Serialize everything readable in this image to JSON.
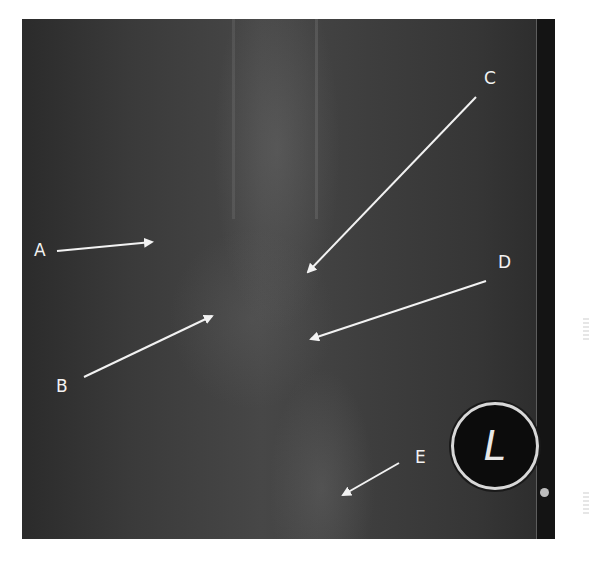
{
  "figure": {
    "type": "radiograph",
    "side_marker": "L",
    "colors": {
      "background": "#ffffff",
      "film": "#3a3a3a",
      "annotation": "#f2f2f2"
    }
  },
  "labels": [
    {
      "id": "A",
      "text": "A",
      "x": 34,
      "y": 242,
      "arrow": {
        "x1": 57,
        "y1": 251,
        "x2": 152,
        "y2": 242
      }
    },
    {
      "id": "B",
      "text": "B",
      "x": 56,
      "y": 378,
      "arrow": {
        "x1": 84,
        "y1": 377,
        "x2": 212,
        "y2": 316
      }
    },
    {
      "id": "C",
      "text": "C",
      "x": 484,
      "y": 70,
      "arrow": {
        "x1": 476,
        "y1": 97,
        "x2": 308,
        "y2": 272
      }
    },
    {
      "id": "D",
      "text": "D",
      "x": 498,
      "y": 254,
      "arrow": {
        "x1": 486,
        "y1": 281,
        "x2": 311,
        "y2": 339
      }
    },
    {
      "id": "E",
      "text": "E",
      "x": 415,
      "y": 449,
      "arrow": {
        "x1": 399,
        "y1": 463,
        "x2": 343,
        "y2": 495
      }
    }
  ]
}
